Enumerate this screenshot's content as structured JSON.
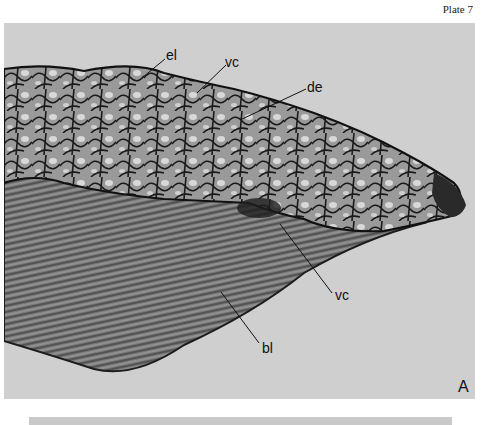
{
  "plate": {
    "title": "Plate 7"
  },
  "figure": {
    "panel_letter": "A",
    "background_color": "#cfcfcf",
    "labels": [
      {
        "id": "el",
        "text": "el"
      },
      {
        "id": "vc-upper",
        "text": "vc"
      },
      {
        "id": "de",
        "text": "de"
      },
      {
        "id": "vc-lower",
        "text": "vc"
      },
      {
        "id": "bl",
        "text": "bl"
      }
    ]
  },
  "next_panel_strip": {
    "color": "#c9c9c9"
  }
}
